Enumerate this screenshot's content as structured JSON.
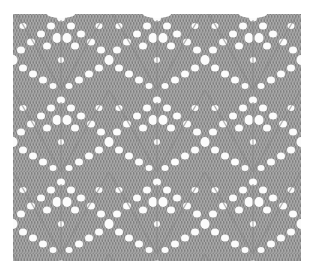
{
  "image": {
    "subject": "knitted lace stitch swatch",
    "description": "Gray knitted fabric with rows of white eyelet holes forming leaf/diamond lace motifs",
    "colors": {
      "background": "#ffffff",
      "yarn": "#9c9c9c",
      "yarn_shadow": "#7e7e7e",
      "yarn_highlight": "#c4c4c4",
      "eyelet": "#fbfbfb"
    }
  }
}
